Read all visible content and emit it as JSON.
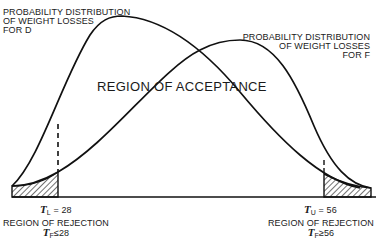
{
  "labels": {
    "distribution_d": [
      "PROBABILITY DISTRIBUTION",
      "OF WEIGHT LOSSES",
      "FOR D"
    ],
    "distribution_f": [
      "PROBABILITY DISTRIBUTION",
      "OF WEIGHT LOSSES",
      "FOR F"
    ],
    "acceptance": "REGION OF ACCEPTANCE",
    "lower_threshold": {
      "symbol": "T",
      "subscript": "L",
      "relation": " = 28"
    },
    "upper_threshold": {
      "symbol": "T",
      "subscript": "U",
      "relation": " = 56"
    },
    "rejection_left": {
      "title": "REGION OF REJECTION",
      "symbol": "T",
      "subscript": "F",
      "condition": "≤28"
    },
    "rejection_right": {
      "title": "REGION OF REJECTION",
      "symbol": "T",
      "subscript": "F",
      "condition": "≥56"
    }
  },
  "values": {
    "lower_threshold": 28,
    "upper_threshold": 56
  },
  "colors": {
    "line": "#111111",
    "background": "#ffffff"
  }
}
